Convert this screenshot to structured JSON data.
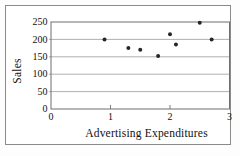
{
  "chart_data": {
    "type": "scatter",
    "title": "",
    "xlabel": "Advertising Expenditures",
    "ylabel": "Sales",
    "points": [
      {
        "x": 0.9,
        "y": 200
      },
      {
        "x": 1.3,
        "y": 175
      },
      {
        "x": 1.5,
        "y": 170
      },
      {
        "x": 1.8,
        "y": 152
      },
      {
        "x": 2.0,
        "y": 215
      },
      {
        "x": 2.1,
        "y": 185
      },
      {
        "x": 2.5,
        "y": 248
      },
      {
        "x": 2.7,
        "y": 200
      }
    ],
    "xlim": [
      0,
      3
    ],
    "ylim": [
      0,
      250
    ],
    "xticks": [
      "0",
      "1",
      "2",
      "3"
    ],
    "yticks": [
      "0",
      "50",
      "100",
      "150",
      "200",
      "250"
    ],
    "grid": "horizontal",
    "legend_position": "none",
    "colors": {
      "point": "#262626",
      "gridline": "#9a9a9a",
      "plot_border": "#6f6f6f",
      "figure_border": "#8a8a8a",
      "text": "#111111",
      "background": "#ffffff"
    }
  }
}
